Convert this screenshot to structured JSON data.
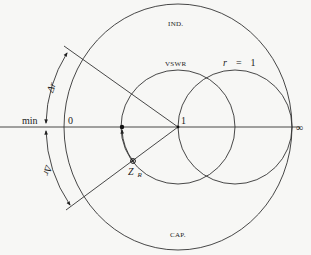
{
  "diagram": {
    "type": "smith-chart-vswr-construction",
    "labels": {
      "top": "IND.",
      "bottom": "CAP.",
      "vswr": "VSWR",
      "r_circle": "r = 1",
      "r_symbol": "r",
      "r_equals": "=",
      "r_value": "1",
      "axis_min": "min",
      "axis_zero": "0",
      "axis_one": "1",
      "axis_inf": "∞",
      "delta_upper": "Δr",
      "delta_lower": "Δr",
      "load": "Z",
      "load_sub": "R"
    },
    "colors": {
      "background": "#f7f7f5",
      "ink": "#333333"
    },
    "geometry": {
      "axis_y": 127,
      "center_one": [
        178,
        127
      ],
      "outer_circle": {
        "cx": 178,
        "cy": 127,
        "rx": 115,
        "ry": 123
      },
      "vswr_circle": {
        "cx": 178,
        "cy": 127,
        "r": 57
      },
      "r1_circle": {
        "cx": 235,
        "cy": 127,
        "r": 57
      },
      "min_point": [
        122,
        127
      ],
      "load_point": [
        133,
        161
      ]
    }
  }
}
